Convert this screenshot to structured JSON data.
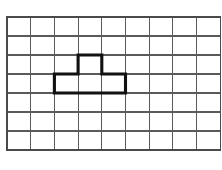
{
  "figure": {
    "background_color": "#ffffff",
    "width": 222,
    "height": 170
  },
  "grid": {
    "columns": 9,
    "rows": 7,
    "line_color": "#5a5a5a",
    "border_color": "#4a4a4a",
    "origin_x": 7,
    "origin_y": 17,
    "cell_width": 23.7,
    "cell_height": 19.0
  },
  "shape": {
    "name": "t-tetromino",
    "stroke_color": "#111111",
    "stroke_width": 3.1,
    "cells": [
      {
        "col": 3,
        "row": 2
      },
      {
        "col": 2,
        "row": 3
      },
      {
        "col": 3,
        "row": 3
      },
      {
        "col": 4,
        "row": 3
      }
    ],
    "outline_points": "3,2 4,2 4,3 5,3 5,4 2,4 2,3 3,3 3,2"
  }
}
